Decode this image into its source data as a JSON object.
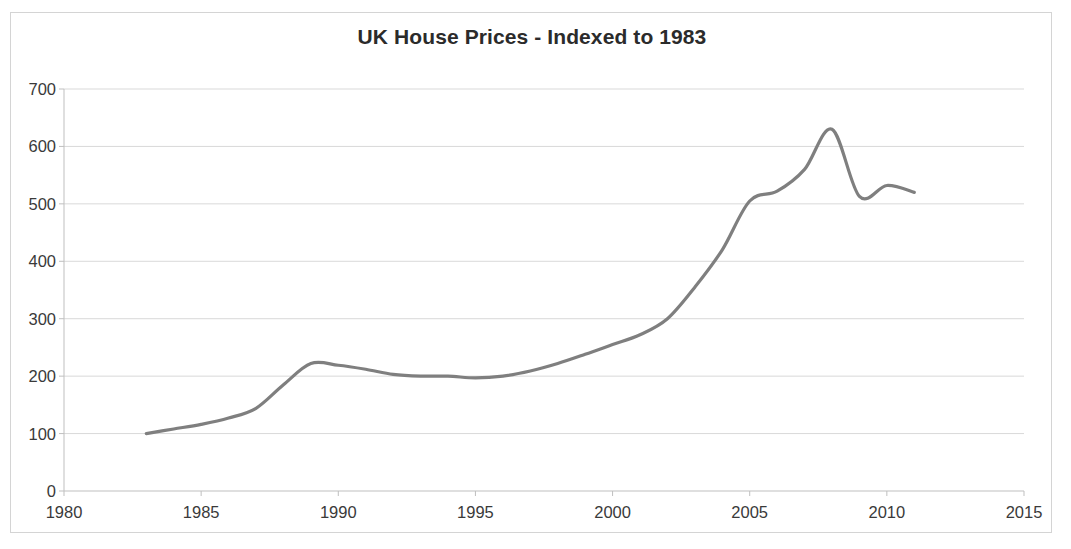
{
  "chart_data": {
    "type": "line",
    "title": "UK House Prices - Indexed to 1983",
    "xlabel": "",
    "ylabel": "",
    "xlim": [
      1980,
      2015
    ],
    "ylim": [
      0,
      700
    ],
    "xticks": [
      1980,
      1985,
      1990,
      1995,
      2000,
      2005,
      2010,
      2015
    ],
    "yticks": [
      0,
      100,
      200,
      300,
      400,
      500,
      600,
      700
    ],
    "grid": "horizontal",
    "legend": "none",
    "line_color": "#7f7f7f",
    "line_width": 3.2,
    "series": [
      {
        "name": "UK House Prices (Index, 1983 = 100)",
        "x": [
          1983,
          1984,
          1985,
          1986,
          1987,
          1988,
          1989,
          1990,
          1991,
          1992,
          1993,
          1994,
          1995,
          1996,
          1997,
          1998,
          1999,
          2000,
          2001,
          2002,
          2003,
          2004,
          2005,
          2006,
          2007,
          2008,
          2009,
          2010,
          2011
        ],
        "values": [
          100,
          108,
          116,
          127,
          144,
          185,
          222,
          219,
          212,
          203,
          200,
          200,
          197,
          200,
          209,
          222,
          238,
          255,
          272,
          300,
          355,
          420,
          505,
          522,
          560,
          630,
          513,
          532,
          520
        ]
      }
    ]
  },
  "axis": {
    "y_labels": [
      "700",
      "600",
      "500",
      "400",
      "300",
      "200",
      "100",
      "0"
    ],
    "x_labels": [
      "1980",
      "1985",
      "1990",
      "1995",
      "2000",
      "2005",
      "2010",
      "2015"
    ]
  },
  "colors": {
    "line": "#7f7f7f",
    "gridline": "#d9d9d9",
    "axis": "#bfbfbf",
    "text": "#3a3a3a",
    "title": "#2b2b2b",
    "frame": "#d4d4d4"
  }
}
